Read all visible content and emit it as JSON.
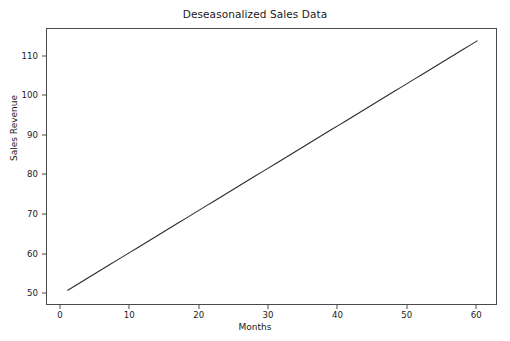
{
  "figure": {
    "background_color": "#ffffff",
    "frame_color": "#4a4a4a",
    "line_color": "#2b2b2b"
  },
  "chart_data": {
    "type": "line",
    "title": "Deseasonalized Sales Data",
    "xlabel": "Months",
    "ylabel": "Sales Revenue",
    "xlim": [
      -2.0,
      63.0
    ],
    "ylim": [
      47.0,
      117.0
    ],
    "xticks": [
      0,
      10,
      20,
      30,
      40,
      50,
      60
    ],
    "xticklabels": [
      "0",
      "10",
      "20",
      "30",
      "40",
      "50",
      "60"
    ],
    "yticks": [
      50,
      60,
      70,
      80,
      90,
      100,
      110
    ],
    "yticklabels": [
      "50",
      "60",
      "70",
      "80",
      "90",
      "100",
      "110"
    ],
    "grid": false,
    "legend": null,
    "series": [
      {
        "name": "Deseasonalized sales",
        "color": "#2b2b2b",
        "linewidth": 1.1,
        "x": [
          1,
          2,
          3,
          4,
          5,
          6,
          7,
          8,
          9,
          10,
          11,
          12,
          13,
          14,
          15,
          16,
          17,
          18,
          19,
          20,
          21,
          22,
          23,
          24,
          25,
          26,
          27,
          28,
          29,
          30,
          31,
          32,
          33,
          34,
          35,
          36,
          37,
          38,
          39,
          40,
          41,
          42,
          43,
          44,
          45,
          46,
          47,
          48,
          49,
          50,
          51,
          52,
          53,
          54,
          55,
          56,
          57,
          58,
          59,
          60
        ],
        "values": [
          51.0,
          52.07,
          53.14,
          54.2,
          55.27,
          56.34,
          57.41,
          58.47,
          59.54,
          60.61,
          61.68,
          62.75,
          63.81,
          64.88,
          65.95,
          67.02,
          68.08,
          69.15,
          70.22,
          71.29,
          72.36,
          73.42,
          74.49,
          75.56,
          76.63,
          77.69,
          78.76,
          79.83,
          80.9,
          81.97,
          83.03,
          84.1,
          85.17,
          86.24,
          87.31,
          88.37,
          89.44,
          90.51,
          91.58,
          92.64,
          93.71,
          94.78,
          95.85,
          96.92,
          97.98,
          99.05,
          100.12,
          101.19,
          102.25,
          103.32,
          104.39,
          105.46,
          106.53,
          107.59,
          108.66,
          109.73,
          110.8,
          111.86,
          112.93,
          114.0
        ]
      }
    ]
  }
}
